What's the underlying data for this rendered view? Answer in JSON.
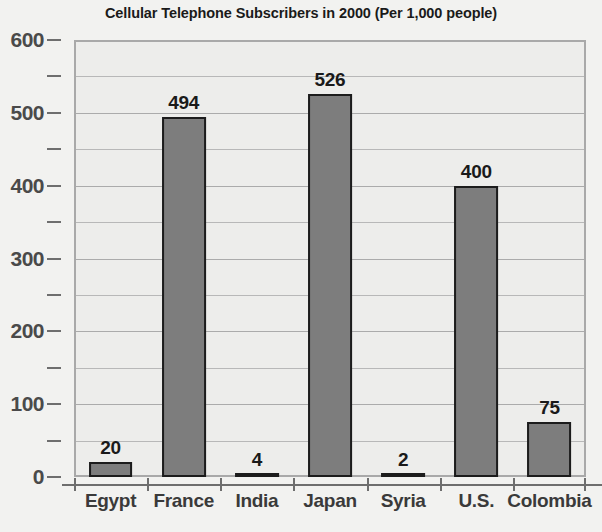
{
  "chart_data": {
    "type": "bar",
    "title": "Cellular Telephone Subscribers in 2000 (Per 1,000 people)",
    "xlabel": "",
    "ylabel": "",
    "categories": [
      "Egypt",
      "France",
      "India",
      "Japan",
      "Syria",
      "U.S.",
      "Colombia"
    ],
    "values": [
      20,
      494,
      4,
      526,
      2,
      400,
      75
    ],
    "value_labels": [
      "20",
      "494",
      "4",
      "526",
      "2",
      "400",
      "75"
    ],
    "ylim": [
      0,
      600
    ],
    "y_major_ticks": [
      0,
      100,
      200,
      300,
      400,
      500,
      600
    ],
    "y_major_tick_labels": [
      "0",
      "100",
      "200",
      "300",
      "400",
      "500",
      "600"
    ],
    "y_minor_ticks": [
      50,
      150,
      250,
      350,
      450,
      550
    ],
    "grid": true,
    "grid_axis": "y",
    "legend": "none",
    "bar_fill_color": "#7d7d7d",
    "bar_edge_color": "#1c1c1c",
    "plot_background_color": "#ededeb",
    "figure_background_color": "#f2f2f0",
    "title_color": "#1a1a1a",
    "tick_label_color": "#4a4a4a"
  }
}
